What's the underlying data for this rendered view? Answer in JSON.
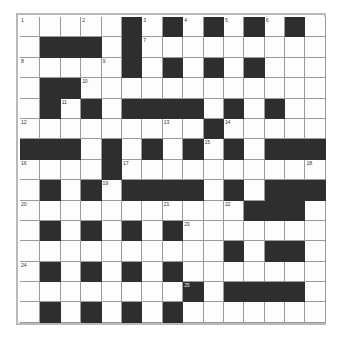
{
  "puzzle": {
    "title": "Crossword Grid",
    "type": "crossword",
    "rows": 15,
    "columns": 15,
    "colors": {
      "white_cell": "#fdfdfd",
      "black_cell": "#2e2e2e",
      "grid_line": "#9a9a9a",
      "frame_border": "#b9b9b9",
      "page_background": "#ffffff",
      "clue_number_text": "#3a3a3a"
    },
    "clue_number_count": 25,
    "clue_numbers": [
      1,
      2,
      3,
      4,
      5,
      6,
      7,
      8,
      9,
      10,
      11,
      12,
      13,
      14,
      15,
      16,
      17,
      18,
      19,
      20,
      21,
      22,
      23,
      24,
      25
    ],
    "grid": [
      [
        "W",
        "W",
        "W",
        "W",
        "W",
        "B",
        "W",
        "B",
        "W",
        "B",
        "W",
        "B",
        "W",
        "B",
        "W"
      ],
      [
        "W",
        "B",
        "B",
        "B",
        "W",
        "B",
        "W",
        "W",
        "W",
        "W",
        "W",
        "W",
        "W",
        "W",
        "W"
      ],
      [
        "W",
        "W",
        "W",
        "W",
        "W",
        "B",
        "W",
        "B",
        "W",
        "B",
        "W",
        "B",
        "W",
        "W",
        "W"
      ],
      [
        "W",
        "B",
        "B",
        "W",
        "W",
        "W",
        "W",
        "W",
        "W",
        "W",
        "W",
        "W",
        "W",
        "W",
        "W"
      ],
      [
        "W",
        "B",
        "W",
        "B",
        "W",
        "B",
        "B",
        "B",
        "B",
        "W",
        "B",
        "W",
        "B",
        "W",
        "W"
      ],
      [
        "W",
        "W",
        "W",
        "W",
        "W",
        "W",
        "W",
        "W",
        "W",
        "B",
        "W",
        "W",
        "W",
        "W",
        "W"
      ],
      [
        "B",
        "B",
        "B",
        "W",
        "B",
        "W",
        "B",
        "W",
        "B",
        "W",
        "B",
        "W",
        "B",
        "B",
        "B"
      ],
      [
        "W",
        "W",
        "W",
        "W",
        "B",
        "W",
        "W",
        "W",
        "W",
        "W",
        "W",
        "W",
        "W",
        "W",
        "W"
      ],
      [
        "W",
        "B",
        "W",
        "B",
        "W",
        "B",
        "B",
        "B",
        "B",
        "W",
        "B",
        "W",
        "B",
        "B",
        "B"
      ],
      [
        "W",
        "W",
        "W",
        "W",
        "W",
        "W",
        "W",
        "W",
        "W",
        "W",
        "W",
        "B",
        "B",
        "B",
        "W"
      ],
      [
        "W",
        "B",
        "W",
        "B",
        "W",
        "B",
        "W",
        "B",
        "W",
        "W",
        "W",
        "W",
        "W",
        "W",
        "W"
      ],
      [
        "W",
        "W",
        "W",
        "W",
        "W",
        "W",
        "W",
        "W",
        "W",
        "W",
        "B",
        "W",
        "B",
        "B",
        "W"
      ],
      [
        "W",
        "B",
        "W",
        "B",
        "W",
        "B",
        "W",
        "B",
        "W",
        "W",
        "W",
        "W",
        "W",
        "W",
        "W"
      ],
      [
        "W",
        "W",
        "W",
        "W",
        "W",
        "W",
        "W",
        "W",
        "B",
        "W",
        "B",
        "B",
        "B",
        "B",
        "W"
      ],
      [
        "W",
        "B",
        "W",
        "B",
        "W",
        "B",
        "W",
        "B",
        "W",
        "W",
        "W",
        "W",
        "W",
        "W",
        "W"
      ]
    ],
    "numbered_cells": [
      {
        "number": 1,
        "row": 1,
        "col": 1
      },
      {
        "number": 2,
        "row": 1,
        "col": 4
      },
      {
        "number": 3,
        "row": 1,
        "col": 7
      },
      {
        "number": 4,
        "row": 1,
        "col": 9
      },
      {
        "number": 5,
        "row": 1,
        "col": 11
      },
      {
        "number": 6,
        "row": 1,
        "col": 13
      },
      {
        "number": 7,
        "row": 2,
        "col": 7
      },
      {
        "number": 8,
        "row": 3,
        "col": 1
      },
      {
        "number": 9,
        "row": 3,
        "col": 5
      },
      {
        "number": 10,
        "row": 4,
        "col": 4
      },
      {
        "number": 11,
        "row": 5,
        "col": 3
      },
      {
        "number": 12,
        "row": 6,
        "col": 1
      },
      {
        "number": 13,
        "row": 6,
        "col": 8
      },
      {
        "number": 14,
        "row": 6,
        "col": 11
      },
      {
        "number": 15,
        "row": 7,
        "col": 10
      },
      {
        "number": 16,
        "row": 8,
        "col": 1
      },
      {
        "number": 17,
        "row": 8,
        "col": 6
      },
      {
        "number": 18,
        "row": 8,
        "col": 15
      },
      {
        "number": 19,
        "row": 9,
        "col": 5
      },
      {
        "number": 20,
        "row": 10,
        "col": 1
      },
      {
        "number": 21,
        "row": 10,
        "col": 8
      },
      {
        "number": 22,
        "row": 10,
        "col": 11
      },
      {
        "number": 23,
        "row": 11,
        "col": 9
      },
      {
        "number": 24,
        "row": 13,
        "col": 1
      },
      {
        "number": 25,
        "row": 14,
        "col": 9
      }
    ]
  }
}
